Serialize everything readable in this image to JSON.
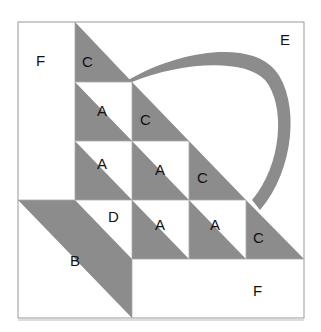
{
  "diagram": {
    "type": "quilt-block-pattern",
    "colors": {
      "shaded": "#8c8c8c",
      "background": "#ffffff",
      "outline": "#999999"
    },
    "labels": {
      "f_top_left": "F",
      "e_top_right": "E",
      "c_row1": "C",
      "a_row2": "A",
      "c_row2": "C",
      "a_row3_col1": "A",
      "a_row3_col2": "A",
      "c_row3": "C",
      "d_row4": "D",
      "a_row4_col2": "A",
      "a_row4_col3": "A",
      "c_row4": "C",
      "b_bottom": "B",
      "f_bottom_right": "F"
    }
  }
}
